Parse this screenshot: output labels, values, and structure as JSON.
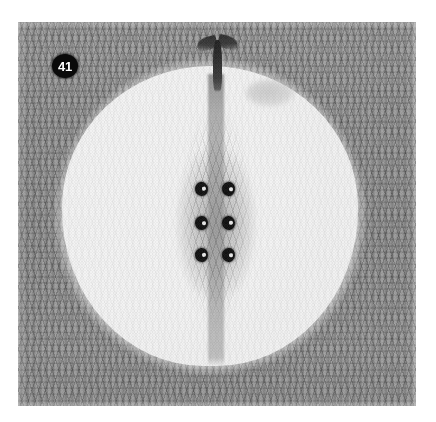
{
  "figure": {
    "number_label": "41",
    "badge_icon_name": "figure-number-badge",
    "caption": "",
    "plate": {
      "x": 18,
      "y": 22,
      "width": 398,
      "height": 384,
      "background_color": "#9c9c9c",
      "texture": "knit-stitch"
    }
  },
  "colors": {
    "page_background": "#ffffff",
    "fabric_gray": "#9c9c9c",
    "fabric_gray_dark": "#6e6e6e",
    "flesh_white": "#ffffff",
    "core_gray": "#8c8c8c",
    "seed_black": "#0d0d0d",
    "seed_highlight": "#f2f2f2",
    "stem_black": "#1e1e1e",
    "badge_background": "#0a0a0a",
    "badge_text": "#ffffff",
    "highlight_smudge": "#cdcdcd"
  },
  "elements": {
    "flesh": {
      "name": "apple-flesh",
      "x": 44,
      "y": 44,
      "width": 296,
      "height": 300
    },
    "core": {
      "name": "apple-core",
      "x": 157,
      "y": 58,
      "width": 82,
      "height": 272
    },
    "stem": {
      "name": "apple-stem",
      "x": 178,
      "y": 8,
      "width": 44,
      "height": 62
    },
    "highlight": {
      "name": "highlight-smudge",
      "x": 228,
      "y": 58,
      "width": 48,
      "height": 26
    }
  },
  "seeds": [
    {
      "id": "seed-top-left",
      "x": 177,
      "y": 160,
      "rotation": -8
    },
    {
      "id": "seed-top-right",
      "x": 204,
      "y": 160,
      "rotation": 6
    },
    {
      "id": "seed-middle-left",
      "x": 177,
      "y": 194,
      "rotation": 4
    },
    {
      "id": "seed-middle-right",
      "x": 204,
      "y": 194,
      "rotation": -5
    },
    {
      "id": "seed-bottom-left",
      "x": 177,
      "y": 226,
      "rotation": -3
    },
    {
      "id": "seed-bottom-right",
      "x": 204,
      "y": 226,
      "rotation": 7
    }
  ],
  "seed_count": 6
}
